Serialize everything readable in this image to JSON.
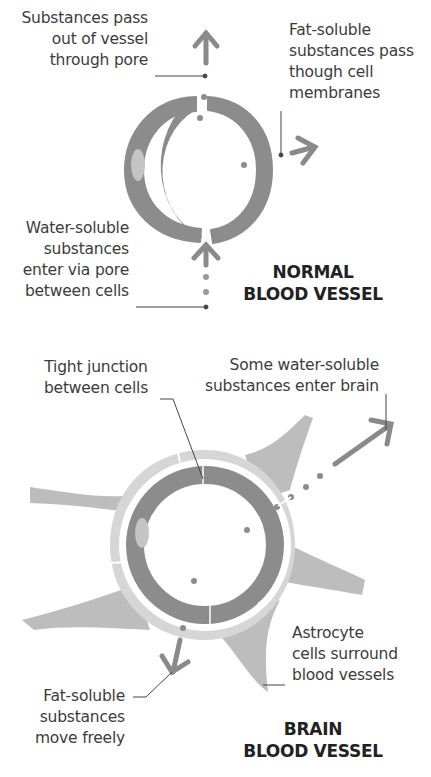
{
  "diagram": {
    "normal": {
      "title_lines": [
        "NORMAL",
        "BLOOD VESSEL"
      ],
      "labels": {
        "pass_out": [
          "Substances pass",
          "out of vessel",
          "through pore"
        ],
        "fat_soluble": [
          "Fat-soluble",
          "substances pass",
          "though cell",
          "membranes"
        ],
        "water_soluble": [
          "Water-soluble",
          "substances",
          "enter via pore",
          "between cells"
        ]
      }
    },
    "brain": {
      "title_lines": [
        "BRAIN",
        "BLOOD VESSEL"
      ],
      "labels": {
        "tight_junction": [
          "Tight junction",
          "between cells"
        ],
        "some_water": [
          "Some water-soluble",
          "substances enter brain"
        ],
        "astrocyte": [
          "Astrocyte",
          "cells surround",
          "blood vessels"
        ],
        "fat_soluble": [
          "Fat-soluble",
          "substances",
          "move freely"
        ]
      }
    },
    "colors": {
      "vessel_wall": "#8c8c8c",
      "nucleus": "#c4c4c4",
      "arrow": "#8a8a8a",
      "astrocyte_dark": "#bdbdbd",
      "astrocyte_light": "#d6d6d6",
      "leader_line": "#444444",
      "text": "#3c3c3c",
      "title": "#222222"
    }
  }
}
